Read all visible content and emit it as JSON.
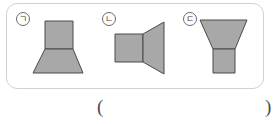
{
  "panel": {
    "name": "figure-panel",
    "border_color": "#d2d2d2",
    "background": "#ffffff"
  },
  "style": {
    "solid_fill": "#a8a8a8",
    "solid_stroke": "#4a4a4a",
    "label_text_color": "#3c3c3c",
    "label_circle_color": "#6b6b6b",
    "paren_color": "#4c4c4c"
  },
  "figures": [
    {
      "id": "figure-1",
      "label": "ㄱ",
      "label_full": "circled giyeok",
      "description": "rectangle stacked on a trapezoid that widens toward the bottom",
      "parts": [
        {
          "name": "top-rectangle",
          "shape": "rectangle"
        },
        {
          "name": "bottom-trapezoid",
          "shape": "trapezoid-wider-bottom"
        }
      ]
    },
    {
      "id": "figure-2",
      "label": "ㄴ",
      "label_full": "circled nieun",
      "description": "square with a trapezoid attached on the right that widens toward the right",
      "parts": [
        {
          "name": "left-square",
          "shape": "square"
        },
        {
          "name": "right-trapezoid",
          "shape": "trapezoid-wider-right"
        }
      ]
    },
    {
      "id": "figure-3",
      "label": "ㄷ",
      "label_full": "circled digeut",
      "description": "inverted trapezoid, wide at the top, stacked on a rectangle",
      "parts": [
        {
          "name": "top-trapezoid",
          "shape": "trapezoid-wider-top"
        },
        {
          "name": "bottom-rectangle",
          "shape": "rectangle"
        }
      ]
    }
  ],
  "answer": {
    "open_paren": "(",
    "close_paren": ")",
    "value": ""
  }
}
